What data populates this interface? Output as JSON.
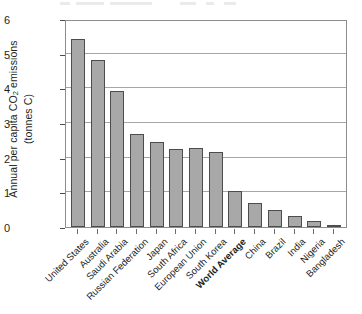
{
  "chart_data": {
    "type": "bar",
    "title": "",
    "subtitle": "",
    "xlabel": "",
    "ylabel": "Annual per capita CO2 emissions (tonnes C)",
    "ylabel_line1": "Annual per capita CO",
    "ylabel_sub": "2",
    "ylabel_line1_end": " emissions",
    "ylabel_line2": "(tonnes C)",
    "ylim": [
      0,
      6
    ],
    "yticks": [
      0,
      1,
      2,
      3,
      4,
      5,
      6
    ],
    "ytick_labels": [
      "0",
      "1",
      "2",
      "3",
      "4",
      "5",
      "6"
    ],
    "grid": "horizontal",
    "legend": "none",
    "bar_color": "#a8a8a8",
    "bar_edge_color": "#4d4d4d",
    "axis_color": "#8d8d8d",
    "gridline_color": "#a6a6a6",
    "categories": [
      "United States",
      "Australia",
      "Saudi Arabia",
      "Russian Federation",
      "Japan",
      "South Africa",
      "European Union",
      "South Korea",
      "World Average",
      "China",
      "Brazil",
      "India",
      "Nigeria",
      "Bangladesh"
    ],
    "values": [
      5.42,
      4.83,
      3.92,
      2.67,
      2.45,
      2.25,
      2.27,
      2.17,
      1.05,
      0.68,
      0.5,
      0.32,
      0.18,
      0.04
    ],
    "emphasized_categories": [
      "World Average"
    ],
    "units": "tonnes C per person per year"
  }
}
